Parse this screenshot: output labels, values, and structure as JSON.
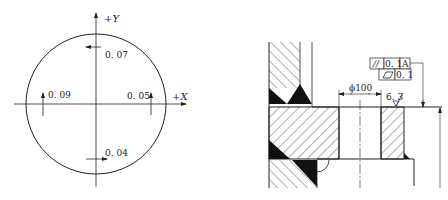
{
  "left_figure": {
    "axes": {
      "x_label": "+X",
      "y_label": "+Y"
    },
    "measurements": [
      {
        "position": "top",
        "value": "0. 07",
        "arrow": "left"
      },
      {
        "position": "left",
        "value": "0. 09",
        "arrow": "up"
      },
      {
        "position": "right",
        "value": "0. 05",
        "arrow": "up"
      },
      {
        "position": "bottom",
        "value": "0. 04",
        "arrow": "right"
      }
    ]
  },
  "right_figure": {
    "diameter_dimension": "ϕ100",
    "surface_roughness": "6. 3",
    "feature_control_frames": [
      {
        "symbol": "//",
        "symbol_name": "parallelism",
        "tolerance": "0. 1",
        "datum": "A"
      },
      {
        "symbol": "▱",
        "symbol_name": "flatness",
        "tolerance": "0. 1"
      }
    ]
  },
  "colors": {
    "line": "#222222",
    "background": "#ffffff"
  }
}
